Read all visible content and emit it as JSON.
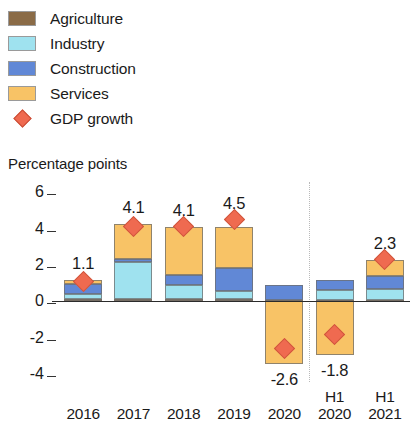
{
  "legend": {
    "items": [
      {
        "label": "Agriculture",
        "color": "#8a6b47",
        "marker": "square",
        "name": "agriculture"
      },
      {
        "label": "Industry",
        "color": "#9fe2ef",
        "marker": "square",
        "name": "industry"
      },
      {
        "label": "Construction",
        "color": "#6188d6",
        "marker": "square",
        "name": "construction"
      },
      {
        "label": "Services",
        "color": "#f8c366",
        "marker": "square",
        "name": "services"
      },
      {
        "label": "GDP growth",
        "color": "#ef6a50",
        "marker": "diamond",
        "name": "gdp-growth"
      }
    ]
  },
  "axis_title": "Percentage points",
  "chart_data": {
    "type": "bar",
    "title": "",
    "subtitle": "",
    "xlabel": "",
    "ylabel": "Percentage points",
    "ylim": [
      -4.6,
      6.4
    ],
    "yticks": [
      6,
      4,
      2,
      0,
      -2,
      -4
    ],
    "ytick_labels": [
      "6",
      "4",
      "2",
      "0",
      "-2",
      "-4"
    ],
    "grid": false,
    "legend_position": "top-left",
    "stacked": true,
    "categories": [
      "2016",
      "2017",
      "2018",
      "2019",
      "2020",
      "H1 2020",
      "H1 2021"
    ],
    "category_lines": [
      [
        "2016"
      ],
      [
        "2017"
      ],
      [
        "2018"
      ],
      [
        "2019"
      ],
      [
        "2020"
      ],
      [
        "H1",
        "2020"
      ],
      [
        "H1",
        "2021"
      ]
    ],
    "series": [
      {
        "name": "Agriculture",
        "color": "#8a6b47",
        "values": [
          0.15,
          0.12,
          0.12,
          0.12,
          0.1,
          0.08,
          0.1
        ]
      },
      {
        "name": "Industry",
        "color": "#9fe2ef",
        "values": [
          0.25,
          2.05,
          0.8,
          0.45,
          0.0,
          0.55,
          0.6
        ]
      },
      {
        "name": "Construction",
        "color": "#6188d6",
        "values": [
          0.55,
          0.15,
          0.55,
          1.25,
          0.8,
          0.55,
          0.7
        ]
      },
      {
        "name": "Services",
        "color": "#f8c366",
        "values": [
          0.25,
          1.95,
          2.6,
          2.25,
          -3.45,
          -2.95,
          0.85
        ]
      }
    ],
    "overlay": {
      "name": "GDP growth",
      "type": "diamond-marker",
      "color": "#ef6a50",
      "values": [
        1.1,
        4.1,
        4.1,
        4.5,
        -2.6,
        -1.8,
        2.3
      ],
      "labels": [
        "1.1",
        "4.1",
        "4.1",
        "4.5",
        "-2.6",
        "-1.8",
        "2.3"
      ]
    },
    "separator_after_category": "2020"
  }
}
